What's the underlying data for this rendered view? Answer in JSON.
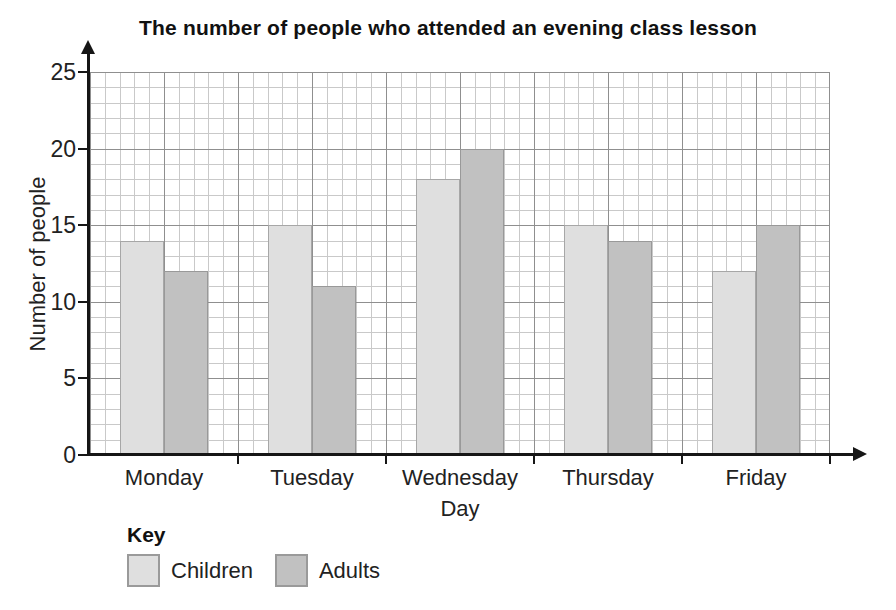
{
  "title": "The number of people who attended an evening class lesson",
  "chart_data": {
    "type": "bar",
    "title": "The number of people who attended an evening class lesson",
    "categories": [
      "Monday",
      "Tuesday",
      "Wednesday",
      "Thursday",
      "Friday"
    ],
    "series": [
      {
        "name": "Children",
        "color": "#dfdfdf",
        "values": [
          14,
          15,
          18,
          15,
          12
        ]
      },
      {
        "name": "Adults",
        "color": "#c1c1c1",
        "values": [
          12,
          11,
          20,
          14,
          15
        ]
      }
    ],
    "xlabel": "Day",
    "ylabel": "Number of people",
    "ylim": [
      0,
      25
    ],
    "yticks": [
      0,
      5,
      10,
      15,
      20,
      25
    ],
    "grid": {
      "style": "graph-paper",
      "minor_step": 1,
      "major_step": 5
    },
    "legend": {
      "title": "Key",
      "entries": [
        "Children",
        "Adults"
      ],
      "position": "bottom-left"
    },
    "axis_color": "#161616"
  }
}
